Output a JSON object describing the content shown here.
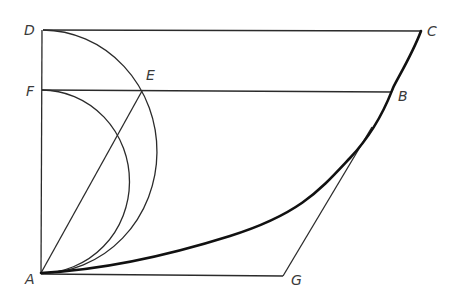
{
  "diagram": {
    "type": "geometric construction",
    "colors": {
      "background": "#ffffff",
      "line": "#2b2b2b",
      "curve": "#111111",
      "label": "#3a3a3a"
    },
    "points": {
      "A": {
        "label": "A",
        "x": 41,
        "y": 273
      },
      "B": {
        "label": "B",
        "x": 391,
        "y": 92
      },
      "C": {
        "label": "C",
        "x": 421,
        "y": 31
      },
      "D": {
        "label": "D",
        "x": 43,
        "y": 30
      },
      "E": {
        "label": "E",
        "x": 142,
        "y": 91
      },
      "F": {
        "label": "F",
        "x": 42,
        "y": 90
      },
      "G": {
        "label": "G",
        "x": 283,
        "y": 276
      }
    },
    "segments": [
      "D-C",
      "F-B",
      "D-A",
      "A-E",
      "A-G",
      "G-tangent-near-B"
    ],
    "arcs": [
      "semicircle on diameter AD",
      "semicircle on diameter AF"
    ],
    "curves": [
      "A-B-C thick curve"
    ]
  }
}
